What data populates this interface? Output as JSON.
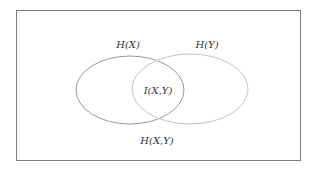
{
  "diagram": {
    "type": "venn",
    "labels": {
      "hx": "H(X)",
      "hy": "H(Y)",
      "ixy": "I(X,Y)",
      "hxy": "H(X,Y)"
    },
    "colors": {
      "left_ellipse": "#9a9a9a",
      "right_ellipse": "#c4c4c4",
      "frame": "#7a7a7a",
      "text": "#333333"
    }
  }
}
